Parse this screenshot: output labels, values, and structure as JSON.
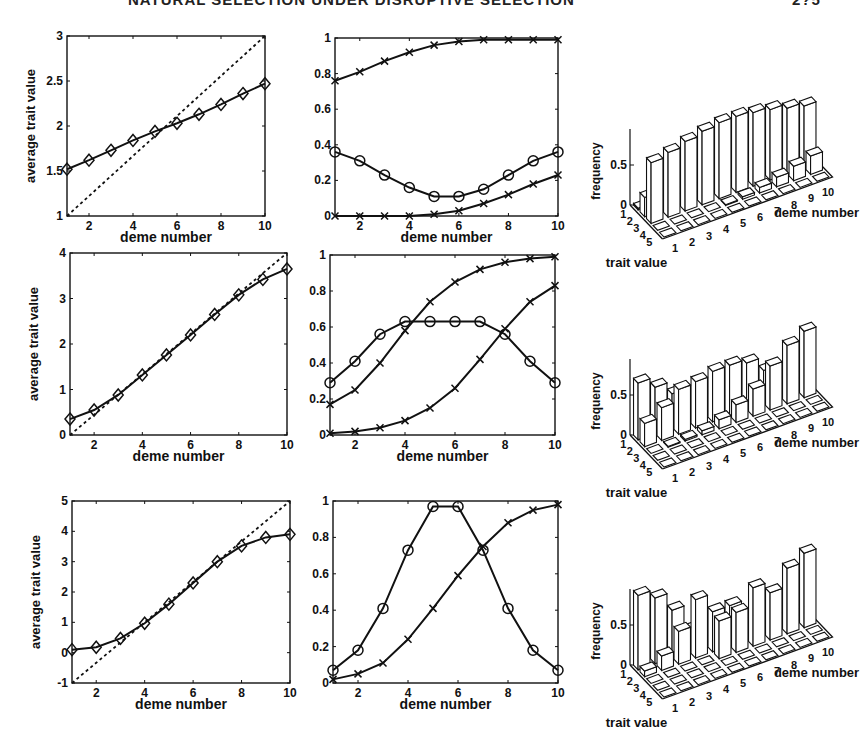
{
  "header": {
    "title": "NATURAL SELECTION UNDER DISRUPTIVE SELECTION",
    "page_number": "2?5"
  },
  "chart_data": [
    {
      "id": "row1-mean",
      "type": "line",
      "title": "",
      "xlabel": "deme number",
      "ylabel": "average trait value",
      "xlim": [
        1,
        10
      ],
      "ylim": [
        1,
        3
      ],
      "xticks": [
        2,
        4,
        6,
        8,
        10
      ],
      "yticks": [
        1,
        1.5,
        2,
        2.5,
        3
      ],
      "ytick_labels": [
        "1",
        "1.5",
        "2",
        "2.5",
        "3"
      ],
      "x": [
        1,
        2,
        3,
        4,
        5,
        6,
        7,
        8,
        9,
        10
      ],
      "series": [
        {
          "name": "average trait",
          "marker": "diamond",
          "style": "solid",
          "values": [
            1.52,
            1.62,
            1.73,
            1.84,
            1.94,
            2.03,
            2.13,
            2.24,
            2.36,
            2.47
          ]
        },
        {
          "name": "reference",
          "marker": "none",
          "style": "dashed",
          "values": [
            1.0,
            1.222,
            1.444,
            1.667,
            1.889,
            2.111,
            2.333,
            2.556,
            2.778,
            3.0
          ]
        }
      ],
      "box": {
        "x0": 67,
        "x1": 265,
        "y0": 36,
        "y1": 216
      }
    },
    {
      "id": "row1-freq",
      "type": "line",
      "xlabel": "deme number",
      "ylabel": "",
      "xlim": [
        1,
        10
      ],
      "ylim": [
        0,
        1
      ],
      "xticks": [
        2,
        4,
        6,
        8,
        10
      ],
      "yticks": [
        0,
        0.2,
        0.4,
        0.6,
        0.8,
        1
      ],
      "ytick_labels": [
        "0",
        "0.2",
        "0.4",
        "0.6",
        "0.8",
        "1"
      ],
      "x": [
        1,
        2,
        3,
        4,
        5,
        6,
        7,
        8,
        9,
        10
      ],
      "series": [
        {
          "name": "upper x",
          "marker": "x",
          "style": "solid",
          "values": [
            0.76,
            0.81,
            0.87,
            0.92,
            0.96,
            0.98,
            0.99,
            0.99,
            0.99,
            0.99
          ]
        },
        {
          "name": "circle",
          "marker": "circle",
          "style": "solid",
          "values": [
            0.36,
            0.31,
            0.23,
            0.16,
            0.11,
            0.11,
            0.15,
            0.23,
            0.31,
            0.36
          ]
        },
        {
          "name": "lower x",
          "marker": "x",
          "style": "solid",
          "values": [
            0.0,
            0.0,
            0.0,
            0.0,
            0.01,
            0.03,
            0.07,
            0.12,
            0.18,
            0.23
          ]
        }
      ],
      "box": {
        "x0": 335,
        "x1": 558,
        "y0": 38,
        "y1": 216
      }
    },
    {
      "id": "row1-hist",
      "type": "bar3d",
      "zlabel": "frequency",
      "xlabel": "deme number",
      "ylabel": "trait value",
      "zticks": [
        "0",
        "0.5"
      ],
      "deme_ticks": [
        "1",
        "2",
        "3",
        "4",
        "5",
        "6",
        "7",
        "8",
        "9",
        "10"
      ],
      "trait_ticks": [
        "1",
        "2",
        "3",
        "4",
        "5"
      ],
      "heights": [
        [
          0.02,
          0.24,
          0.76,
          0.0,
          0.0
        ],
        [
          0.0,
          0.19,
          0.81,
          0.0,
          0.0
        ],
        [
          0.0,
          0.13,
          0.87,
          0.0,
          0.0
        ],
        [
          0.0,
          0.08,
          0.92,
          0.0,
          0.0
        ],
        [
          0.0,
          0.04,
          0.95,
          0.01,
          0.0
        ],
        [
          0.0,
          0.02,
          0.95,
          0.03,
          0.0
        ],
        [
          0.0,
          0.01,
          0.92,
          0.07,
          0.0
        ],
        [
          0.0,
          0.0,
          0.88,
          0.12,
          0.0
        ],
        [
          0.0,
          0.0,
          0.82,
          0.18,
          0.0
        ],
        [
          0.0,
          0.0,
          0.77,
          0.23,
          0.0
        ]
      ],
      "origin": {
        "x": 630,
        "y": 205
      }
    },
    {
      "id": "row2-mean",
      "type": "line",
      "xlabel": "deme number",
      "ylabel": "average trait value",
      "xlim": [
        1,
        10
      ],
      "ylim": [
        0,
        4
      ],
      "xticks": [
        2,
        4,
        6,
        8,
        10
      ],
      "yticks": [
        0,
        1,
        2,
        3,
        4
      ],
      "ytick_labels": [
        "0",
        "1",
        "2",
        "3",
        "4"
      ],
      "x": [
        1,
        2,
        3,
        4,
        5,
        6,
        7,
        8,
        9,
        10
      ],
      "series": [
        {
          "name": "average trait",
          "marker": "diamond",
          "style": "solid",
          "values": [
            0.35,
            0.55,
            0.88,
            1.32,
            1.76,
            2.2,
            2.65,
            3.08,
            3.42,
            3.65
          ]
        },
        {
          "name": "reference",
          "marker": "none",
          "style": "dashed",
          "values": [
            0.0,
            0.444,
            0.889,
            1.333,
            1.778,
            2.222,
            2.667,
            3.111,
            3.556,
            4.0
          ]
        }
      ],
      "box": {
        "x0": 70,
        "x1": 287,
        "y0": 253,
        "y1": 435
      }
    },
    {
      "id": "row2-freq",
      "type": "line",
      "xlabel": "deme number",
      "ylabel": "",
      "xlim": [
        1,
        10
      ],
      "ylim": [
        0,
        1
      ],
      "xticks": [
        2,
        4,
        6,
        8,
        10
      ],
      "yticks": [
        0,
        0.2,
        0.4,
        0.6,
        0.8,
        1
      ],
      "ytick_labels": [
        "0",
        "0.2",
        "0.4",
        "0.6",
        "0.8",
        "1"
      ],
      "x": [
        1,
        2,
        3,
        4,
        5,
        6,
        7,
        8,
        9,
        10
      ],
      "series": [
        {
          "name": "upper x",
          "marker": "x",
          "style": "solid",
          "values": [
            0.17,
            0.25,
            0.4,
            0.58,
            0.74,
            0.85,
            0.92,
            0.96,
            0.98,
            0.99
          ]
        },
        {
          "name": "circle",
          "marker": "circle",
          "style": "solid",
          "values": [
            0.29,
            0.41,
            0.56,
            0.63,
            0.63,
            0.63,
            0.63,
            0.56,
            0.41,
            0.29
          ]
        },
        {
          "name": "lower x",
          "marker": "x",
          "style": "solid",
          "values": [
            0.01,
            0.02,
            0.04,
            0.08,
            0.15,
            0.26,
            0.42,
            0.59,
            0.74,
            0.83
          ]
        }
      ],
      "box": {
        "x0": 330,
        "x1": 555,
        "y0": 255,
        "y1": 435
      }
    },
    {
      "id": "row2-hist",
      "type": "bar3d",
      "zlabel": "frequency",
      "xlabel": "deme number",
      "ylabel": "trait value",
      "zticks": [
        "0",
        "0.5"
      ],
      "deme_ticks": [
        "1",
        "2",
        "3",
        "4",
        "5",
        "6",
        "7",
        "8",
        "9",
        "10"
      ],
      "trait_ticks": [
        "1",
        "2",
        "3",
        "4",
        "5"
      ],
      "heights": [
        [
          0.71,
          0.29,
          0.0,
          0.0,
          0.0
        ],
        [
          0.58,
          0.41,
          0.01,
          0.0,
          0.0
        ],
        [
          0.42,
          0.56,
          0.02,
          0.0,
          0.0
        ],
        [
          0.37,
          0.58,
          0.05,
          0.0,
          0.0
        ],
        [
          0.26,
          0.63,
          0.11,
          0.0,
          0.0
        ],
        [
          0.15,
          0.63,
          0.22,
          0.0,
          0.0
        ],
        [
          0.08,
          0.58,
          0.34,
          0.0,
          0.0
        ],
        [
          0.04,
          0.41,
          0.55,
          0.0,
          0.0
        ],
        [
          0.02,
          0.25,
          0.73,
          0.0,
          0.0
        ],
        [
          0.01,
          0.16,
          0.83,
          0.0,
          0.0
        ]
      ],
      "origin": {
        "x": 630,
        "y": 435
      }
    },
    {
      "id": "row3-mean",
      "type": "line",
      "xlabel": "deme number",
      "ylabel": "average trait value",
      "xlim": [
        1,
        10
      ],
      "ylim": [
        -1,
        5
      ],
      "xticks": [
        2,
        4,
        6,
        8,
        10
      ],
      "yticks": [
        -1,
        0,
        1,
        2,
        3,
        4,
        5
      ],
      "ytick_labels": [
        "-1",
        "0",
        "1",
        "2",
        "3",
        "4",
        "5"
      ],
      "x": [
        1,
        2,
        3,
        4,
        5,
        6,
        7,
        8,
        9,
        10
      ],
      "series": [
        {
          "name": "average trait",
          "marker": "diamond",
          "style": "solid",
          "values": [
            0.1,
            0.18,
            0.47,
            0.97,
            1.6,
            2.3,
            3.0,
            3.52,
            3.8,
            3.9
          ]
        },
        {
          "name": "reference",
          "marker": "none",
          "style": "dashed",
          "values": [
            -1.0,
            -0.333,
            0.333,
            1.0,
            1.667,
            2.333,
            3.0,
            3.667,
            4.333,
            5.0
          ]
        }
      ],
      "box": {
        "x0": 72,
        "x1": 290,
        "y0": 501,
        "y1": 683
      }
    },
    {
      "id": "row3-freq",
      "type": "line",
      "xlabel": "deme number",
      "ylabel": "",
      "xlim": [
        1,
        10
      ],
      "ylim": [
        0,
        1
      ],
      "xticks": [
        2,
        4,
        6,
        8,
        10
      ],
      "yticks": [
        0,
        0.2,
        0.4,
        0.6,
        0.8,
        1
      ],
      "ytick_labels": [
        "0",
        "0.2",
        "0.4",
        "0.6",
        "0.8",
        "1"
      ],
      "x": [
        1,
        2,
        3,
        4,
        5,
        6,
        7,
        8,
        9,
        10
      ],
      "series": [
        {
          "name": "circle",
          "marker": "circle",
          "style": "solid",
          "values": [
            0.07,
            0.18,
            0.41,
            0.73,
            0.97,
            0.97,
            0.73,
            0.41,
            0.18,
            0.07
          ]
        },
        {
          "name": "x",
          "marker": "x",
          "style": "solid",
          "values": [
            0.02,
            0.05,
            0.11,
            0.24,
            0.41,
            0.59,
            0.75,
            0.88,
            0.95,
            0.98
          ]
        }
      ],
      "box": {
        "x0": 333,
        "x1": 558,
        "y0": 501,
        "y1": 683
      }
    },
    {
      "id": "row3-hist",
      "type": "bar3d",
      "zlabel": "frequency",
      "xlabel": "deme number",
      "ylabel": "trait value",
      "zticks": [
        "0",
        "0.5"
      ],
      "deme_ticks": [
        "1",
        "2",
        "3",
        "4",
        "5",
        "6",
        "7",
        "8",
        "9",
        "10"
      ],
      "trait_ticks": [
        "1",
        "2",
        "3",
        "4",
        "5"
      ],
      "heights": [
        [
          0.93,
          0.07,
          0.0,
          0.0,
          0.0
        ],
        [
          0.82,
          0.18,
          0.0,
          0.0,
          0.0
        ],
        [
          0.59,
          0.41,
          0.0,
          0.0,
          0.0
        ],
        [
          0.27,
          0.73,
          0.0,
          0.0,
          0.0
        ],
        [
          0.03,
          0.5,
          0.47,
          0.0,
          0.0
        ],
        [
          0.0,
          0.5,
          0.5,
          0.0,
          0.0
        ],
        [
          0.0,
          0.27,
          0.73,
          0.0,
          0.0
        ],
        [
          0.0,
          0.41,
          0.59,
          0.0,
          0.0
        ],
        [
          0.0,
          0.18,
          0.82,
          0.0,
          0.0
        ],
        [
          0.0,
          0.07,
          0.93,
          0.0,
          0.0
        ]
      ],
      "origin": {
        "x": 630,
        "y": 665
      }
    }
  ]
}
